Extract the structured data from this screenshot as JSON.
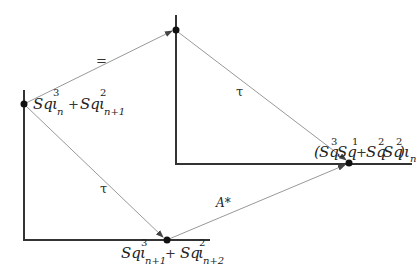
{
  "diagram": {
    "type": "commutative-diagram",
    "nodes": {
      "left": {
        "base": "Sq",
        "sup1": "3",
        "iota": "ι",
        "sub1": "n",
        "plus": "+",
        "base2": "Sq",
        "sup2": "2",
        "iota2": "ι",
        "sub2": "n+1"
      },
      "bottom": {
        "base": "Sq",
        "sup1": "3",
        "iota": "ι",
        "sub1": "n+1",
        "plus": "+",
        "base2": "Sq",
        "sup2": "2",
        "iota2": "ι",
        "sub2": "n+2"
      },
      "right": {
        "open": "(",
        "base": "Sq",
        "sup1": "3",
        "base_b": "Sq",
        "sup1b": "1",
        "plus": "+",
        "base2": "Sq",
        "sup2": "2",
        "base2b": "Sq",
        "sup2b": "2",
        "close": ")",
        "iota": "ι",
        "sub": "n"
      }
    },
    "arrows": {
      "top": "=",
      "left_down": "τ",
      "right_down": "τ",
      "bottom_right": "A*"
    },
    "colors": {
      "axis": "#333333",
      "arrow": "#888888",
      "dot": "#111111"
    }
  }
}
